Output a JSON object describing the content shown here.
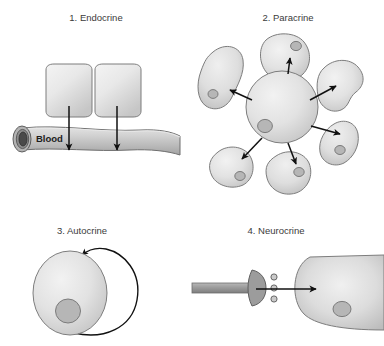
{
  "figure": {
    "title_visible": false,
    "background_color": "#ffffff",
    "panel_count": 4,
    "colors": {
      "cell_fill_light": "#ededed",
      "cell_fill_mid": "#d3d3d3",
      "cell_edge": "#7d7d7d",
      "nucleus_fill": "#b6b6b6",
      "nucleus_edge": "#7b7b7b",
      "arrow": "#111111",
      "vessel_fill": "#c9c9c9",
      "vessel_lumen": "#4a4a4a",
      "axon_fill": "#9a9a9a",
      "label_text": "#3b3b3b"
    }
  },
  "panels": [
    {
      "index": "1",
      "number_label": "1.",
      "name": "Endocrine",
      "label": "1. Endocrine",
      "description": "Two secretory cells release signal into a blood vessel",
      "secreting_cell_count": 2,
      "arrow_count": 2,
      "vessel_label": "Blood",
      "target": "distant cells via bloodstream"
    },
    {
      "index": "2",
      "number_label": "2.",
      "name": "Paracrine",
      "label": "2. Paracrine",
      "description": "One central cell signals to six neighbouring cells",
      "central_cell_count": 1,
      "neighbor_cell_count": 6,
      "arrow_count": 6,
      "target": "adjacent neighbouring cells"
    },
    {
      "index": "3",
      "number_label": "3.",
      "name": "Autocrine",
      "label": "3. Autocrine",
      "description": "A single cell signals back onto itself via a looping arrow",
      "cell_count": 1,
      "arrow_count": 1,
      "target": "itself"
    },
    {
      "index": "4",
      "number_label": "4.",
      "name": "Neurocrine",
      "label": "4. Neurocrine",
      "description": "Axon terminal releases neurotransmitter across a synapse onto a target cell",
      "axon_count": 1,
      "vesicle_count": 3,
      "arrow_count": 1,
      "target": "post-synaptic target cell"
    }
  ],
  "labels": {
    "panel_1": "1. Endocrine",
    "panel_2": "2. Paracrine",
    "panel_3": "3. Autocrine",
    "panel_4": "4. Neurocrine",
    "blood": "Blood"
  }
}
